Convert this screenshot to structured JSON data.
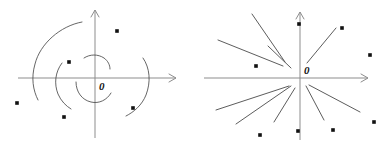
{
  "figure": {
    "background_color": "#ffffff",
    "width": 381,
    "height": 153,
    "axis_color": "#8d8d8d",
    "curve_color": "#4a4a4a",
    "dot_color": "#111111",
    "label_color": "#161616"
  },
  "panels": [
    {
      "id": "left",
      "name": "spiral-phase-portrait",
      "description": "Coordinate axes with spiral trajectory arcs winding about the origin",
      "origin_label": "0",
      "origin": {
        "x": 95,
        "y": 78
      },
      "axes": {
        "x_axis": {
          "x1": 18,
          "y1": 78,
          "x2": 176,
          "y2": 78,
          "arrow": "right"
        },
        "y_axis": {
          "x1": 95,
          "y1": 138,
          "x2": 95,
          "y2": 10,
          "arrow": "up"
        }
      },
      "curves": [
        {
          "name": "outer-spiral-arc",
          "path": "M 82 22 C 60 26 40 44 35 64 C 31 78 33 90 38 100"
        },
        {
          "name": "mid-left-spiral-arc",
          "path": "M 62 63 C 55 72 54 84 58 94 C 61 101 66 106 71 109"
        },
        {
          "name": "inner-lower-spiral-arc",
          "path": "M 76 82 C 76 92 82 100 91 102 C 99 104 107 100 111 93"
        },
        {
          "name": "inner-upper-spiral-arc",
          "path": "M 84 58 C 90 54 98 54 104 58 C 108 61 110 65 110 69"
        },
        {
          "name": "outer-right-spiral-arc",
          "path": "M 143 58 C 150 68 151 82 146 95 C 142 105 134 112 126 116"
        }
      ],
      "dots": [
        {
          "x": 117,
          "y": 31
        },
        {
          "x": 69,
          "y": 62
        },
        {
          "x": 17,
          "y": 103
        },
        {
          "x": 64,
          "y": 117
        },
        {
          "x": 133,
          "y": 108
        }
      ]
    },
    {
      "id": "right",
      "name": "star-node-phase-portrait",
      "description": "Coordinate axes with straight-line trajectories radiating from the origin",
      "origin_label": "0",
      "origin": {
        "x": 110,
        "y": 78
      },
      "axes": {
        "x_axis": {
          "x1": 14,
          "y1": 78,
          "x2": 178,
          "y2": 78,
          "arrow": "right"
        },
        "y_axis": {
          "x1": 110,
          "y1": 140,
          "x2": 110,
          "y2": 12,
          "arrow": "up"
        }
      },
      "rays": [
        {
          "name": "ray-upper-left-steep",
          "x1": 95,
          "y1": 62,
          "x2": 62,
          "y2": 14
        },
        {
          "name": "ray-upper-left-shallow",
          "x1": 93,
          "y1": 66,
          "x2": 28,
          "y2": 40
        },
        {
          "name": "ray-upper-left-mid",
          "x1": 101,
          "y1": 68,
          "x2": 78,
          "y2": 46
        },
        {
          "name": "ray-upper-right-steep",
          "x1": 117,
          "y1": 63,
          "x2": 146,
          "y2": 28
        },
        {
          "name": "ray-lower-left-shallow",
          "x1": 99,
          "y1": 86,
          "x2": 26,
          "y2": 110
        },
        {
          "name": "ray-lower-left-mid",
          "x1": 101,
          "y1": 86,
          "x2": 46,
          "y2": 124
        },
        {
          "name": "ray-lower-left-steep",
          "x1": 105,
          "y1": 88,
          "x2": 84,
          "y2": 122
        },
        {
          "name": "ray-lower-right-steep",
          "x1": 116,
          "y1": 86,
          "x2": 134,
          "y2": 120
        },
        {
          "name": "ray-lower-right-shallow",
          "x1": 119,
          "y1": 85,
          "x2": 170,
          "y2": 112
        }
      ],
      "dots": [
        {
          "x": 152,
          "y": 28
        },
        {
          "x": 109,
          "y": 24
        },
        {
          "x": 180,
          "y": 55
        },
        {
          "x": 66,
          "y": 66
        },
        {
          "x": 184,
          "y": 122
        },
        {
          "x": 143,
          "y": 130
        },
        {
          "x": 108,
          "y": 131
        },
        {
          "x": 70,
          "y": 135
        }
      ]
    }
  ]
}
